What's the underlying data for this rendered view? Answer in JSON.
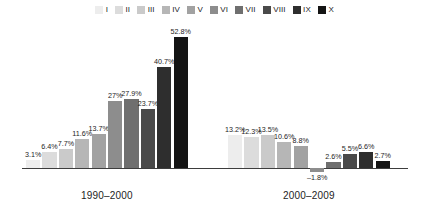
{
  "legend": {
    "items": [
      {
        "label": "I",
        "color": "#ededed"
      },
      {
        "label": "II",
        "color": "#dcdcdc"
      },
      {
        "label": "III",
        "color": "#cacaca"
      },
      {
        "label": "IV",
        "color": "#b6b6b6"
      },
      {
        "label": "V",
        "color": "#a2a2a2"
      },
      {
        "label": "VI",
        "color": "#8d8d8d"
      },
      {
        "label": "VII",
        "color": "#6f6f6f"
      },
      {
        "label": "VIII",
        "color": "#4a4a4a"
      },
      {
        "label": "IX",
        "color": "#2e2e2e"
      },
      {
        "label": "X",
        "color": "#141414"
      }
    ]
  },
  "chart_data": {
    "type": "bar",
    "title": "",
    "xlabel": "",
    "ylabel": "",
    "grid": false,
    "legend_position": "top",
    "categories": [
      "I",
      "II",
      "III",
      "IV",
      "V",
      "VI",
      "VII",
      "VIII",
      "IX",
      "X"
    ],
    "ylim": [
      -5,
      55
    ],
    "groups": [
      {
        "name": "1990–2000",
        "caption": "1990–2000",
        "bars": [
          {
            "series": "I",
            "value": 3.1,
            "label": "3.1%",
            "color": "#ededed"
          },
          {
            "series": "II",
            "value": 6.4,
            "label": "6.4%",
            "color": "#dcdcdc"
          },
          {
            "series": "III",
            "value": 7.7,
            "label": "7.7%",
            "color": "#cacaca"
          },
          {
            "series": "IV",
            "value": 11.6,
            "label": "11.6%",
            "color": "#b6b6b6"
          },
          {
            "series": "V",
            "value": 13.7,
            "label": "13.7%",
            "color": "#a2a2a2"
          },
          {
            "series": "VI",
            "value": 27.0,
            "label": "27%",
            "color": "#8d8d8d"
          },
          {
            "series": "VII",
            "value": 27.9,
            "label": "27.9%",
            "color": "#6f6f6f"
          },
          {
            "series": "VIII",
            "value": 23.7,
            "label": "23.7%",
            "color": "#4a4a4a"
          },
          {
            "series": "IX",
            "value": 40.7,
            "label": "40.7%",
            "color": "#2e2e2e"
          },
          {
            "series": "X",
            "value": 52.8,
            "label": "52.8%",
            "color": "#141414"
          }
        ]
      },
      {
        "name": "2000–2009",
        "caption": "2000–2009",
        "bars": [
          {
            "series": "I",
            "value": 13.2,
            "label": "13.2%",
            "color": "#ededed"
          },
          {
            "series": "II",
            "value": 12.3,
            "label": "12.3%",
            "color": "#dcdcdc"
          },
          {
            "series": "III",
            "value": 13.5,
            "label": "13.5%",
            "color": "#cacaca"
          },
          {
            "series": "IV",
            "value": 10.6,
            "label": "10.6%",
            "color": "#b6b6b6"
          },
          {
            "series": "V",
            "value": 8.8,
            "label": "8.8%",
            "color": "#a2a2a2"
          },
          {
            "series": "VI",
            "value": -1.8,
            "label": "–1.8%",
            "color": "#8d8d8d"
          },
          {
            "series": "VII",
            "value": 2.6,
            "label": "2.6%",
            "color": "#6f6f6f"
          },
          {
            "series": "VIII",
            "value": 5.5,
            "label": "5.5%",
            "color": "#4a4a4a"
          },
          {
            "series": "IX",
            "value": 6.6,
            "label": "6.6%",
            "color": "#2e2e2e"
          },
          {
            "series": "X",
            "value": 2.7,
            "label": "2.7%",
            "color": "#141414"
          }
        ]
      }
    ]
  },
  "axis": {
    "captions": [
      "1990–2000",
      "2000–2009"
    ]
  }
}
